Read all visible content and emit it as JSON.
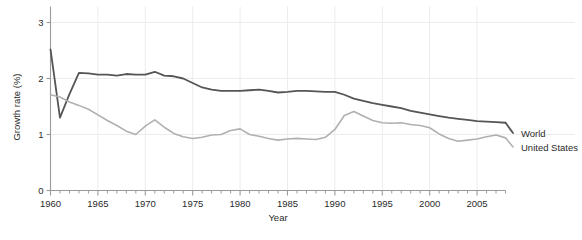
{
  "chart_data": {
    "type": "line",
    "title": "",
    "xlabel": "Year",
    "ylabel": "Growth rate (%)",
    "xlim": [
      1960,
      2008
    ],
    "ylim": [
      0,
      3
    ],
    "grid": true,
    "legend_position": "right",
    "y_ticks": [
      "0",
      "1",
      "2",
      "3"
    ],
    "y_tick_values": [
      0,
      1,
      2,
      3
    ],
    "x_ticks": [
      "1960",
      "1965",
      "1970",
      "1975",
      "1980",
      "1985",
      "1990",
      "1995",
      "2000",
      "2005"
    ],
    "x_tick_values": [
      1960,
      1965,
      1970,
      1975,
      1980,
      1985,
      1990,
      1995,
      2000,
      2005
    ],
    "x_minor_step": 1,
    "x": [
      1960,
      1961,
      1962,
      1963,
      1964,
      1965,
      1966,
      1967,
      1968,
      1969,
      1970,
      1971,
      1972,
      1973,
      1974,
      1975,
      1976,
      1977,
      1978,
      1979,
      1980,
      1981,
      1982,
      1983,
      1984,
      1985,
      1986,
      1987,
      1988,
      1989,
      1990,
      1991,
      1992,
      1993,
      1994,
      1995,
      1996,
      1997,
      1998,
      1999,
      2000,
      2001,
      2002,
      2003,
      2004,
      2005,
      2006,
      2007,
      2008
    ],
    "series": [
      {
        "name": "World",
        "color": "#555555",
        "width": 1.8,
        "values": [
          2.52,
          1.3,
          1.72,
          2.1,
          2.09,
          2.07,
          2.07,
          2.05,
          2.08,
          2.07,
          2.07,
          2.12,
          2.05,
          2.04,
          2.0,
          1.92,
          1.84,
          1.8,
          1.78,
          1.78,
          1.78,
          1.79,
          1.8,
          1.78,
          1.75,
          1.76,
          1.78,
          1.78,
          1.77,
          1.76,
          1.76,
          1.71,
          1.64,
          1.6,
          1.56,
          1.53,
          1.5,
          1.47,
          1.42,
          1.39,
          1.36,
          1.33,
          1.3,
          1.28,
          1.26,
          1.24,
          1.23,
          1.22,
          1.21
        ]
      },
      {
        "name": "United States",
        "color": "#b0b0b0",
        "width": 1.6,
        "values": [
          1.71,
          1.67,
          1.58,
          1.52,
          1.45,
          1.35,
          1.25,
          1.16,
          1.06,
          1.0,
          1.15,
          1.26,
          1.13,
          1.02,
          0.96,
          0.93,
          0.95,
          0.99,
          1.0,
          1.07,
          1.1,
          1.0,
          0.97,
          0.93,
          0.9,
          0.92,
          0.93,
          0.92,
          0.91,
          0.95,
          1.09,
          1.34,
          1.41,
          1.33,
          1.25,
          1.21,
          1.2,
          1.21,
          1.18,
          1.16,
          1.12,
          1.01,
          0.93,
          0.88,
          0.9,
          0.92,
          0.96,
          0.99,
          0.94
        ]
      }
    ]
  },
  "legend": {
    "entries": [
      {
        "label": "World"
      },
      {
        "label": "United States"
      }
    ]
  },
  "axes": {
    "x_title": "Year",
    "y_title": "Growth rate (%)"
  }
}
